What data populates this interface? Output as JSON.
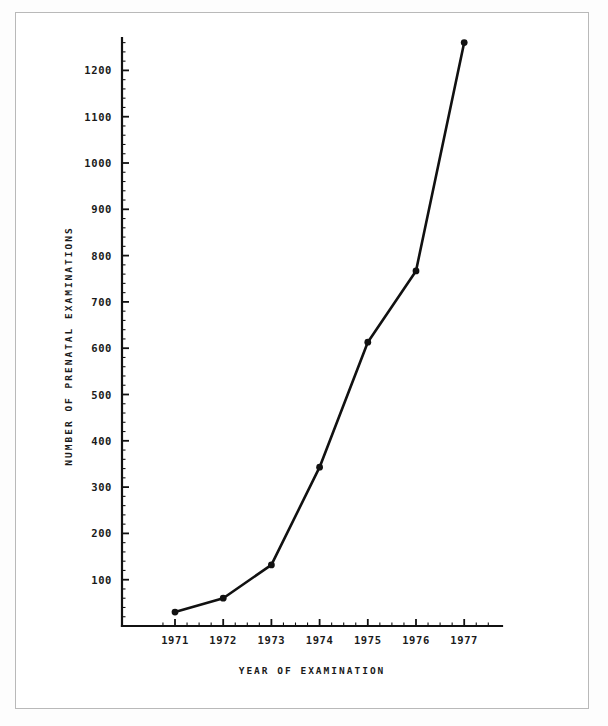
{
  "figure": {
    "background_color": "#ffffff",
    "border_color": "#b9b9b9",
    "ink_color": "#111111"
  },
  "chart_data": {
    "type": "line",
    "title": "",
    "subtitle": "",
    "xlabel": "YEAR OF EXAMINATION",
    "ylabel": "NUMBER OF PRENATAL EXAMINATIONS",
    "categories": [
      "1971",
      "1972",
      "1973",
      "1974",
      "1975",
      "1976",
      "1977"
    ],
    "x": [
      1971,
      1972,
      1973,
      1974,
      1975,
      1976,
      1977
    ],
    "values": [
      30,
      60,
      132,
      343,
      613,
      767,
      1260
    ],
    "series": [
      {
        "name": "Number of prenatal examinations",
        "values": [
          30,
          60,
          132,
          343,
          613,
          767,
          1260
        ]
      }
    ],
    "xlim": [
      1970.5,
      1977.9
    ],
    "ylim": [
      0,
      1290
    ],
    "ytick_labels": [
      "100",
      "200",
      "300",
      "400",
      "500",
      "600",
      "700",
      "800",
      "900",
      "1000",
      "1100",
      "1200"
    ],
    "ytick_values": [
      100,
      200,
      300,
      400,
      500,
      600,
      700,
      800,
      900,
      1000,
      1100,
      1200
    ],
    "xtick_labels": [
      "1971",
      "1972",
      "1973",
      "1974",
      "1975",
      "1976",
      "1977"
    ],
    "grid": false,
    "legend": "none",
    "marker": "filled-circle",
    "line_color": "#111111",
    "marker_color": "#111111"
  },
  "axes": {
    "x_axis_title": "YEAR OF EXAMINATION",
    "y_axis_title": "NUMBER OF PRENATAL EXAMINATIONS"
  }
}
